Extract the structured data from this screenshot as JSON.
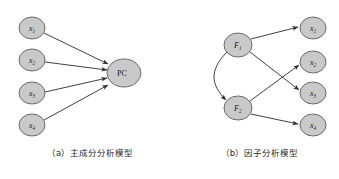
{
  "page": {
    "clipped_header_text": "—— —— ─",
    "background_color": "#ffffff"
  },
  "style": {
    "node_fill": "#c9c9c9",
    "node_stroke": "#6b6b6b",
    "arrow_color": "#2b2b2b",
    "text_color": "#1c1a19"
  },
  "panels": [
    {
      "id": "a",
      "caption": "（a）主成分分析模型",
      "nodes": [
        {
          "id": "x1",
          "base": "x",
          "sub": "1",
          "cx": 32,
          "cy": 28,
          "rx": 13,
          "ry": 11
        },
        {
          "id": "x2",
          "base": "x",
          "sub": "2",
          "cx": 32,
          "cy": 60,
          "rx": 13,
          "ry": 11
        },
        {
          "id": "x3",
          "base": "x",
          "sub": "3",
          "cx": 32,
          "cy": 93,
          "rx": 13,
          "ry": 11
        },
        {
          "id": "x4",
          "base": "x",
          "sub": "4",
          "cx": 32,
          "cy": 125,
          "rx": 13,
          "ry": 11
        },
        {
          "id": "pc",
          "base": "PC",
          "sub": "",
          "cx": 124,
          "cy": 73,
          "rx": 17,
          "ry": 14
        }
      ],
      "edges": [
        {
          "from": "x1",
          "to": "pc",
          "type": "arrow"
        },
        {
          "from": "x2",
          "to": "pc",
          "type": "arrow"
        },
        {
          "from": "x3",
          "to": "pc",
          "type": "arrow"
        },
        {
          "from": "x4",
          "to": "pc",
          "type": "arrow"
        }
      ]
    },
    {
      "id": "b",
      "caption": "（b）因子分析模型",
      "nodes": [
        {
          "id": "F1",
          "base": "F",
          "sub": "1",
          "cx": 58,
          "cy": 45,
          "rx": 14,
          "ry": 12
        },
        {
          "id": "F2",
          "base": "F",
          "sub": "2",
          "cx": 58,
          "cy": 108,
          "rx": 14,
          "ry": 12
        },
        {
          "id": "x1",
          "base": "x",
          "sub": "1",
          "cx": 133,
          "cy": 28,
          "rx": 13,
          "ry": 11
        },
        {
          "id": "x2",
          "base": "x",
          "sub": "2",
          "cx": 133,
          "cy": 62,
          "rx": 13,
          "ry": 11
        },
        {
          "id": "x3",
          "base": "x",
          "sub": "3",
          "cx": 133,
          "cy": 93,
          "rx": 13,
          "ry": 11
        },
        {
          "id": "x4",
          "base": "x",
          "sub": "4",
          "cx": 133,
          "cy": 125,
          "rx": 13,
          "ry": 11
        }
      ],
      "edges": [
        {
          "from": "F1",
          "to": "x1",
          "type": "arrow"
        },
        {
          "from": "F1",
          "to": "x3",
          "type": "arrow"
        },
        {
          "from": "F2",
          "to": "x2",
          "type": "arrow"
        },
        {
          "from": "F2",
          "to": "x4",
          "type": "arrow"
        },
        {
          "from": "F1",
          "to": "F2",
          "type": "curved-double-arrow"
        }
      ]
    }
  ]
}
